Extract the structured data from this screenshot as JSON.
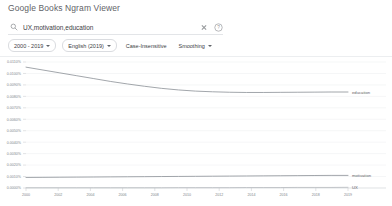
{
  "header": {
    "app_title": "Google Books Ngram Viewer"
  },
  "search": {
    "value": "UX,motivation,education",
    "placeholder": "Search in Google Books",
    "search_icon": "search-icon",
    "clear_icon": "close-icon",
    "help_icon": "help-circle-icon"
  },
  "filters": [
    {
      "label": "2000 - 2019",
      "has_caret": true
    },
    {
      "label": "English (2019)",
      "has_caret": true
    },
    {
      "label": "Case-Insensitive",
      "has_caret": false
    },
    {
      "label": "Smoothing",
      "has_caret": true
    }
  ],
  "chart_data": {
    "type": "line",
    "title": "",
    "xlabel": "",
    "ylabel": "",
    "xlim": [
      2000,
      2019
    ],
    "ylim": [
      0.0,
      0.011
    ],
    "grid": true,
    "legend_position": "right-inline",
    "x": [
      2000,
      2001,
      2002,
      2003,
      2004,
      2005,
      2006,
      2007,
      2008,
      2009,
      2010,
      2011,
      2012,
      2013,
      2014,
      2015,
      2016,
      2017,
      2018,
      2019
    ],
    "xticks": [
      "2000",
      "2002",
      "2004",
      "2006",
      "2008",
      "2010",
      "2012",
      "2014",
      "2016",
      "2018",
      "2019"
    ],
    "yticks": [
      "0.0000%",
      "0.0010%",
      "0.0020%",
      "0.0030%",
      "0.0040%",
      "0.0050%",
      "0.0060%",
      "0.0070%",
      "0.0080%",
      "0.0090%",
      "0.0100%",
      "0.0110%"
    ],
    "series": [
      {
        "name": "education",
        "color": "#8a8f96",
        "end_label": "education",
        "values": [
          0.01055,
          0.0103,
          0.01005,
          0.0098,
          0.00955,
          0.0093,
          0.00908,
          0.00888,
          0.0087,
          0.00856,
          0.00846,
          0.0084,
          0.00836,
          0.00834,
          0.00834,
          0.00835,
          0.00836,
          0.00837,
          0.00838,
          0.00838
        ]
      },
      {
        "name": "motivation",
        "color": "#8a8f96",
        "end_label": "motivation",
        "values": [
          0.00092,
          0.00093,
          0.00094,
          0.00095,
          0.00096,
          0.00097,
          0.00098,
          0.00099,
          0.001,
          0.00101,
          0.00102,
          0.00103,
          0.00104,
          0.00105,
          0.00106,
          0.00107,
          0.00108,
          0.00109,
          0.0011,
          0.0011
        ]
      },
      {
        "name": "UX",
        "color": "#b5b9be",
        "end_label": "UX",
        "values": [
          2e-05,
          2e-05,
          2e-05,
          2e-05,
          2e-05,
          2e-05,
          2e-05,
          2e-05,
          2e-05,
          3e-05,
          3e-05,
          3e-05,
          3e-05,
          4e-05,
          4e-05,
          4e-05,
          5e-05,
          5e-05,
          5e-05,
          6e-05
        ]
      }
    ]
  }
}
